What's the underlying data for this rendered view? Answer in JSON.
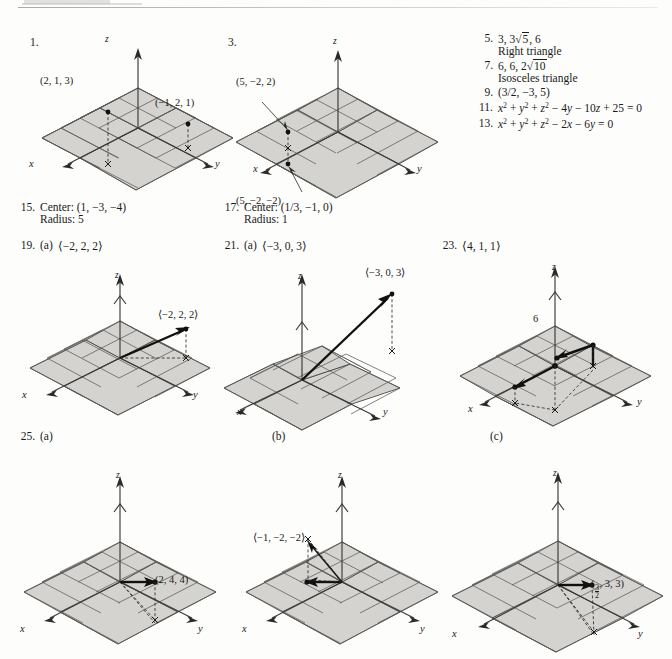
{
  "page": {
    "background": "#fdfdfc",
    "plane_fill": "#d5d3cf",
    "ink": "#1a1a1a"
  },
  "answers": {
    "col3": [
      {
        "num": "5.",
        "line1": "3, 3√5, 6",
        "line2": "Right triangle"
      },
      {
        "num": "7.",
        "line1": "6, 6, 2√10",
        "line2": "Isosceles triangle"
      },
      {
        "num": "9.",
        "line1": "(3/2, −3, 5)",
        "line2": ""
      },
      {
        "num": "11.",
        "line1": "x² + y² + z² − 4y − 10z + 25 = 0",
        "line2": ""
      },
      {
        "num": "13.",
        "line1": "x² + y² + z² − 2x − 6y = 0",
        "line2": ""
      }
    ],
    "item15": {
      "num": "15.",
      "center": "Center: (1, −3, −4)",
      "radius": "Radius: 5"
    },
    "item17": {
      "num": "17.",
      "center": "Center: (1/3, −1, 0)",
      "radius": "Radius: 1"
    },
    "item19": {
      "num": "19.",
      "part": "(a)",
      "value": "⟨−2, 2, 2⟩"
    },
    "item21": {
      "num": "21.",
      "part": "(a)",
      "value": "⟨−3, 0, 3⟩"
    },
    "item23": {
      "num": "23.",
      "value": "⟨4, 1, 1⟩"
    },
    "item25": {
      "num": "25.",
      "part_a": "(a)",
      "part_b": "(b)",
      "part_c": "(c)"
    }
  },
  "figures": {
    "fig1": {
      "num": "1.",
      "axis_x": "x",
      "axis_y": "y",
      "axis_z": "z",
      "label_a": "(2, 1, 3)",
      "label_b": "(−1, 2, 1)"
    },
    "fig3": {
      "num": "3.",
      "axis_x": "x",
      "axis_y": "y",
      "axis_z": "z",
      "label_a": "(5, −2, 2)",
      "label_b": "(5, −2, −2)"
    },
    "fig19": {
      "axis_x": "x",
      "axis_y": "y",
      "axis_z": "z",
      "label_a": "⟨−2, 2, 2⟩"
    },
    "fig21": {
      "axis_x": "x",
      "axis_y": "y",
      "axis_z": "z",
      "label_a": "⟨−3, 0, 3⟩"
    },
    "fig23": {
      "axis_x": "x",
      "axis_y": "y",
      "axis_z": "z",
      "label_six": "6"
    },
    "fig25a": {
      "axis_x": "x",
      "axis_y": "y",
      "axis_z": "z",
      "label_a": "(2, 4, 4)"
    },
    "fig25b": {
      "axis_x": "x",
      "axis_y": "y",
      "axis_z": "z",
      "label_a": "⟨−1, −2, −2⟩"
    },
    "fig25c": {
      "axis_x": "x",
      "axis_y": "y",
      "axis_z": "z",
      "label_prefix": "(",
      "frac_num": "3",
      "frac_den": "2",
      "label_suffix": ", 3, 3)"
    }
  }
}
